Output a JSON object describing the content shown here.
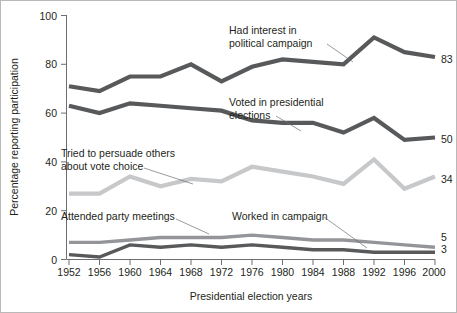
{
  "chart_data": {
    "type": "line",
    "title": "",
    "xlabel": "Presidential election years",
    "ylabel": "Percentage reporting participation",
    "ylim": [
      0,
      100
    ],
    "yticks": [
      0,
      20,
      40,
      60,
      80,
      100
    ],
    "grid": false,
    "legend_position": "inline-annotations",
    "categories": [
      "1952",
      "1956",
      "1960",
      "1964",
      "1968",
      "1972",
      "1976",
      "1980",
      "1984",
      "1988",
      "1992",
      "1996",
      "2000"
    ],
    "series": [
      {
        "name": "Had interest in political campaign",
        "color": "#58595b",
        "end_value_label": "83",
        "values": [
          71,
          69,
          75,
          75,
          80,
          73,
          79,
          82,
          81,
          80,
          91,
          85,
          83
        ]
      },
      {
        "name": "Voted in presidential elections",
        "color": "#58595b",
        "end_value_label": "50",
        "values": [
          63,
          60,
          64,
          63,
          62,
          61,
          57,
          56,
          56,
          52,
          58,
          49,
          50
        ]
      },
      {
        "name": "Tried to persuade others about vote choice",
        "color": "#c7c8ca",
        "end_value_label": "34",
        "values": [
          27,
          27,
          34,
          30,
          33,
          32,
          38,
          36,
          34,
          31,
          41,
          29,
          34
        ]
      },
      {
        "name": "Attended party meetings",
        "color": "#939598",
        "end_value_label": "5",
        "values": [
          7,
          7,
          8,
          9,
          9,
          9,
          10,
          9,
          8,
          8,
          7,
          6,
          5
        ]
      },
      {
        "name": "Worked in campaign",
        "color": "#58595b",
        "end_value_label": "3",
        "values": [
          2,
          1,
          6,
          5,
          6,
          5,
          6,
          5,
          4,
          4,
          3,
          3,
          3
        ]
      }
    ]
  },
  "annotations": [
    {
      "id": "had-interest",
      "line1": "Had interest in",
      "line2": "political campaign"
    },
    {
      "id": "voted",
      "line1": "Voted in presidential",
      "line2": "elections"
    },
    {
      "id": "persuade",
      "line1": "Tried to persuade others",
      "line2": "about vote choice"
    },
    {
      "id": "attended",
      "line1": "Attended party meetings",
      "line2": ""
    },
    {
      "id": "worked",
      "line1": "Worked in campaign",
      "line2": ""
    }
  ],
  "axes": {
    "y_title": "Percentage reporting participation",
    "x_title": "Presidential election years",
    "y_tick_labels": [
      "0",
      "20",
      "40",
      "60",
      "80",
      "100"
    ],
    "x_tick_labels": [
      "1952",
      "1956",
      "1960",
      "1964",
      "1968",
      "1972",
      "1976",
      "1980",
      "1984",
      "1988",
      "1992",
      "1996",
      "2000"
    ]
  },
  "end_labels": {
    "had_interest": "83",
    "voted": "50",
    "persuade": "34",
    "attended": "5",
    "worked": "3"
  }
}
